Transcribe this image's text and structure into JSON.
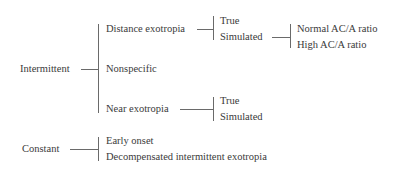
{
  "diagram": {
    "type": "classification-tree",
    "colors": {
      "text": "#3a3a3a",
      "line": "#6a6a6a",
      "background": "#ffffff"
    },
    "root_nodes": [
      {
        "label": "Intermittent",
        "children": [
          {
            "label": "Distance exotropia",
            "children": [
              {
                "label": "True"
              },
              {
                "label": "Simulated",
                "children": [
                  {
                    "label": "Normal AC/A ratio"
                  },
                  {
                    "label": "High AC/A ratio"
                  }
                ]
              }
            ]
          },
          {
            "label": "Nonspecific"
          },
          {
            "label": "Near exotropia",
            "children": [
              {
                "label": "True"
              },
              {
                "label": "Simulated"
              }
            ]
          }
        ]
      },
      {
        "label": "Constant",
        "children": [
          {
            "label": "Early onset"
          },
          {
            "label": "Decompensated intermittent exotropia"
          }
        ]
      }
    ]
  }
}
